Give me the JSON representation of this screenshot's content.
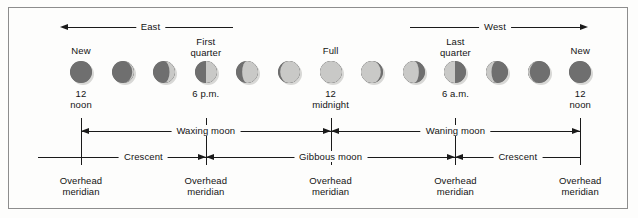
{
  "figure": {
    "background_color": "#fdfdfc",
    "border_color": "#8d8d8d",
    "dark_color": "#6f6f6f",
    "light_color": "#c9c9c7",
    "line_color": "#1a1a1a"
  },
  "direction_arrows": [
    {
      "label": "East",
      "direction": "left"
    },
    {
      "label": "West",
      "direction": "right"
    }
  ],
  "phase_names": [
    {
      "label": "New",
      "moon_index": 0
    },
    {
      "label": "First quarter",
      "line1": "First",
      "line2": "quarter",
      "moon_index": 3
    },
    {
      "label": "Full",
      "moon_index": 6
    },
    {
      "label": "Last quarter",
      "line1": "Last",
      "line2": "quarter",
      "moon_index": 9
    },
    {
      "label": "New",
      "moon_index": 12
    }
  ],
  "time_labels": [
    {
      "line1": "12",
      "line2": "noon",
      "moon_index": 0
    },
    {
      "line1": "6 p.m.",
      "line2": "",
      "moon_index": 3
    },
    {
      "line1": "12",
      "line2": "midnight",
      "moon_index": 6
    },
    {
      "line1": "6 a.m.",
      "line2": "",
      "moon_index": 9
    },
    {
      "line1": "12",
      "line2": "noon",
      "moon_index": 12
    }
  ],
  "moons": [
    {
      "index": 0,
      "phase": "new",
      "illuminated_fraction": 0.0,
      "lit_side": "right"
    },
    {
      "index": 1,
      "phase": "waxing crescent",
      "illuminated_fraction": 0.08,
      "lit_side": "right"
    },
    {
      "index": 2,
      "phase": "waxing crescent",
      "illuminated_fraction": 0.25,
      "lit_side": "right"
    },
    {
      "index": 3,
      "phase": "first quarter",
      "illuminated_fraction": 0.5,
      "lit_side": "right"
    },
    {
      "index": 4,
      "phase": "waxing gibbous",
      "illuminated_fraction": 0.72,
      "lit_side": "right"
    },
    {
      "index": 5,
      "phase": "waxing gibbous",
      "illuminated_fraction": 0.9,
      "lit_side": "right"
    },
    {
      "index": 6,
      "phase": "full",
      "illuminated_fraction": 1.0,
      "lit_side": "right"
    },
    {
      "index": 7,
      "phase": "waning gibbous",
      "illuminated_fraction": 0.9,
      "lit_side": "left"
    },
    {
      "index": 8,
      "phase": "waning gibbous",
      "illuminated_fraction": 0.72,
      "lit_side": "left"
    },
    {
      "index": 9,
      "phase": "last quarter",
      "illuminated_fraction": 0.5,
      "lit_side": "left"
    },
    {
      "index": 10,
      "phase": "waning crescent",
      "illuminated_fraction": 0.25,
      "lit_side": "left"
    },
    {
      "index": 11,
      "phase": "waning crescent",
      "illuminated_fraction": 0.08,
      "lit_side": "left"
    },
    {
      "index": 12,
      "phase": "new",
      "illuminated_fraction": 0.0,
      "lit_side": "left"
    }
  ],
  "span_rows": [
    {
      "row": "upper",
      "spans": [
        {
          "label": "Waxing moon",
          "from_moon": 0,
          "to_moon": 6,
          "arrow_start": "left",
          "arrow_end": "right"
        },
        {
          "label": "Waning moon",
          "from_moon": 6,
          "to_moon": 12,
          "arrow_start": "left",
          "arrow_end": "right"
        }
      ]
    },
    {
      "row": "lower",
      "spans": [
        {
          "label": "Crescent",
          "from_moon": 0,
          "to_moon": 3,
          "arrow_start": "none",
          "arrow_end": "right"
        },
        {
          "label": "Gibbous moon",
          "from_moon": 3,
          "to_moon": 9,
          "arrow_start": "left",
          "arrow_end": "right"
        },
        {
          "label": "Crescent",
          "from_moon": 9,
          "to_moon": 12,
          "arrow_start": "left",
          "arrow_end": "none"
        }
      ]
    }
  ],
  "meridian_labels": [
    {
      "line1": "Overhead",
      "line2": "meridian",
      "moon_index": 0
    },
    {
      "line1": "Overhead",
      "line2": "meridian",
      "moon_index": 3
    },
    {
      "line1": "Overhead",
      "line2": "meridian",
      "moon_index": 6
    },
    {
      "line1": "Overhead",
      "line2": "meridian",
      "moon_index": 9
    },
    {
      "line1": "Overhead",
      "line2": "meridian",
      "moon_index": 12
    }
  ]
}
